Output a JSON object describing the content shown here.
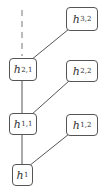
{
  "diagram": {
    "type": "tree",
    "nodes": [
      {
        "id": "h32",
        "base": "h",
        "sub": "3,2"
      },
      {
        "id": "h21",
        "base": "h",
        "sub": "2,1"
      },
      {
        "id": "h22",
        "base": "h",
        "sub": "2,2"
      },
      {
        "id": "h11",
        "base": "h",
        "sub": "1,1"
      },
      {
        "id": "h12",
        "base": "h",
        "sub": "1,2"
      },
      {
        "id": "h1",
        "base": "h",
        "sub": "1"
      }
    ],
    "edges": [
      {
        "from": "h21",
        "to": "h32",
        "style": "solid"
      },
      {
        "from": "h21",
        "to": "h11",
        "style": "solid"
      },
      {
        "from": "h22",
        "to": "h11",
        "style": "solid"
      },
      {
        "from": "h11",
        "to": "h1",
        "style": "solid"
      },
      {
        "from": "h12",
        "to": "h1",
        "style": "solid"
      },
      {
        "from": "h21",
        "to": "above",
        "style": "dashed"
      }
    ],
    "colors": {
      "stroke": "#555555",
      "text": "#333333",
      "background": "#ffffff"
    }
  }
}
